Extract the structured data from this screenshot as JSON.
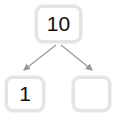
{
  "diagram": {
    "type": "binary-tree",
    "root": {
      "value": "10"
    },
    "children": [
      {
        "value": "1"
      },
      {
        "value": ""
      }
    ],
    "colors": {
      "node_border": "#e4e4e4",
      "edge": "#999999",
      "text": "#111111"
    }
  }
}
